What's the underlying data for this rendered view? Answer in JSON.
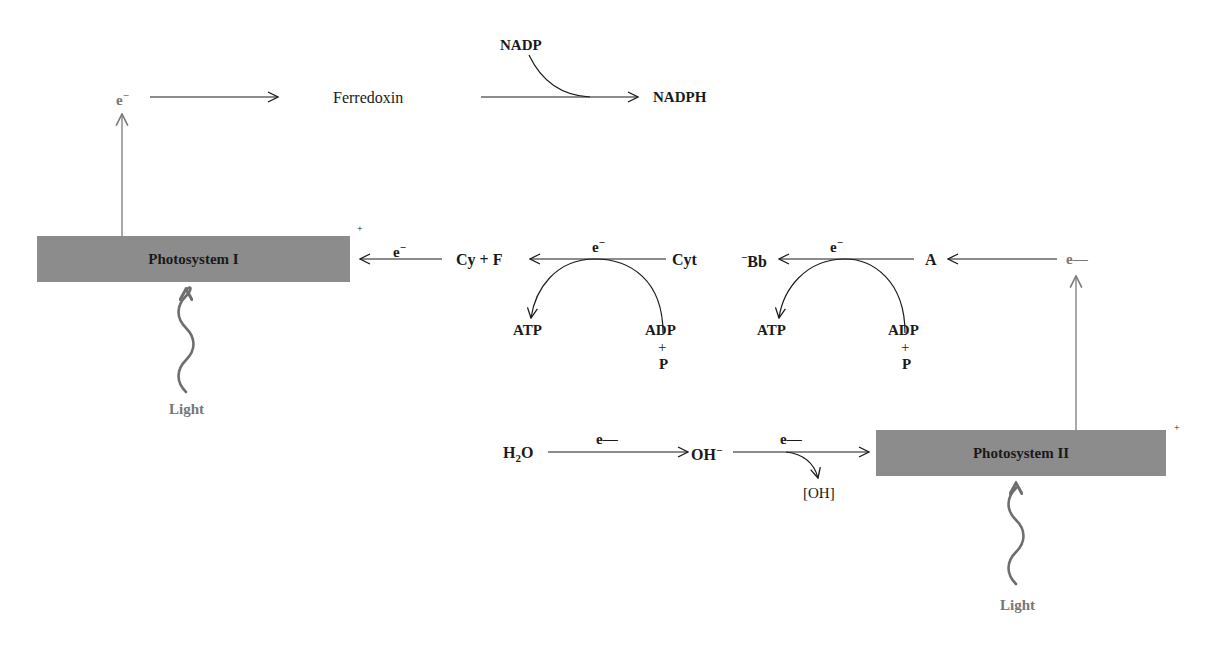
{
  "diagram": {
    "colors": {
      "box_fill": "#8c8c8c",
      "gray_label": "#777777",
      "line": "#1a1a1a",
      "gray_line": "#7a7a7a"
    },
    "nodes": {
      "e_top": "e",
      "e_top_sup": "−",
      "ferredoxin": "Ferredoxin",
      "nadp": "NADP",
      "nadph": "NADPH",
      "ps1": "Photosystem I",
      "ps1_charge": "+",
      "ps1_in_e": "e",
      "ps1_in_e_sup": "−",
      "cyf": "Cy + F",
      "cyt": "Cyt",
      "e_mid1": "e",
      "e_mid1_sup": "−",
      "atp1": "ATP",
      "adp1": "ADP",
      "plus1": "+",
      "p1": "P",
      "bb": "Bb",
      "bb_sup": "−",
      "e_mid2": "e",
      "e_mid2_sup": "−",
      "atp2": "ATP",
      "adp2": "ADP",
      "plus2": "+",
      "p2": "P",
      "a": "A",
      "e_right": "e—",
      "light1": "Light",
      "h2o_h": "H",
      "h2o_sub": "2",
      "h2o_o": "O",
      "e_h2o": "e—",
      "oh": "OH",
      "oh_sup": "−",
      "e_oh": "e—",
      "oh_bracket": "[OH]",
      "ps2": "Photosystem II",
      "ps2_charge": "+",
      "light2": "Light"
    }
  }
}
